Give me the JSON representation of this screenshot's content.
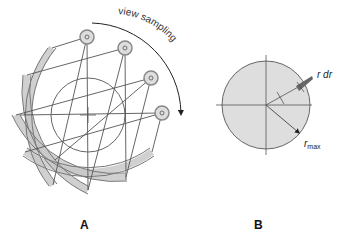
{
  "panels": [
    {
      "id": "A",
      "label": "A",
      "annotation": "view sampling"
    },
    {
      "id": "B",
      "label": "B",
      "annotation_rdr": "r dr",
      "annotation_rmax_r": "r",
      "annotation_rmax_sub": "max"
    }
  ],
  "colors": {
    "fill": "#dedede",
    "stroke": "#6a6a6a",
    "detector": "#c8c8c8",
    "detector_stroke": "#888888",
    "ray": "#555555"
  }
}
